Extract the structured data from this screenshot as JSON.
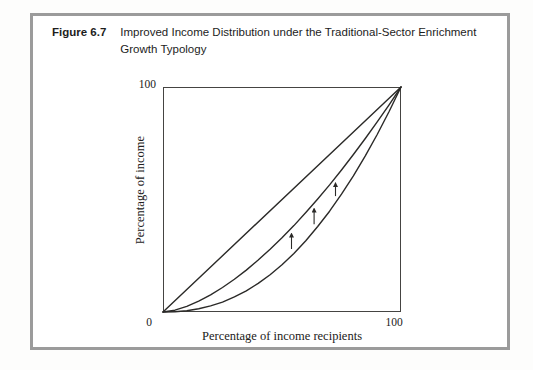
{
  "figure": {
    "label": "Figure 6.7",
    "title_line1": "Improved Income Distribution under the Traditional-Sector Enrichment",
    "title_line2": "Growth Typology"
  },
  "chart_data": {
    "type": "line",
    "xlabel": "Percentage of income recipients",
    "ylabel": "Percentage of income",
    "xlim": [
      0,
      100
    ],
    "ylim": [
      0,
      100
    ],
    "grid": false,
    "legend": "none",
    "ticks": {
      "origin": "0",
      "x_max": "100",
      "y_max": "100"
    },
    "series": [
      {
        "name": "line-of-equality",
        "description": "45-degree line of perfect equality",
        "points": [
          [
            0,
            0
          ],
          [
            100,
            100
          ]
        ]
      },
      {
        "name": "improved-lorenz-curve",
        "description": "Lorenz curve after traditional-sector enrichment growth (shifted up)",
        "points": [
          [
            0,
            0
          ],
          [
            5,
            0.8
          ],
          [
            10,
            2.5
          ],
          [
            15,
            4.8
          ],
          [
            20,
            7.6
          ],
          [
            25,
            10.9
          ],
          [
            30,
            14.6
          ],
          [
            35,
            18.6
          ],
          [
            40,
            23.1
          ],
          [
            45,
            27.9
          ],
          [
            50,
            33.0
          ],
          [
            55,
            38.4
          ],
          [
            60,
            44.2
          ],
          [
            65,
            50.2
          ],
          [
            70,
            56.5
          ],
          [
            75,
            63.1
          ],
          [
            80,
            70.0
          ],
          [
            85,
            77.1
          ],
          [
            90,
            84.5
          ],
          [
            95,
            92.1
          ],
          [
            100,
            100
          ]
        ]
      },
      {
        "name": "original-lorenz-curve",
        "description": "Original Lorenz curve (more unequal)",
        "points": [
          [
            0,
            0
          ],
          [
            5,
            0.1
          ],
          [
            10,
            0.6
          ],
          [
            15,
            1.4
          ],
          [
            20,
            2.7
          ],
          [
            25,
            4.4
          ],
          [
            30,
            6.7
          ],
          [
            35,
            9.4
          ],
          [
            40,
            12.7
          ],
          [
            45,
            16.6
          ],
          [
            50,
            21.0
          ],
          [
            55,
            26.0
          ],
          [
            60,
            31.7
          ],
          [
            65,
            38.0
          ],
          [
            70,
            44.8
          ],
          [
            75,
            52.4
          ],
          [
            80,
            60.5
          ],
          [
            85,
            69.4
          ],
          [
            90,
            78.9
          ],
          [
            95,
            89.1
          ],
          [
            100,
            100
          ]
        ]
      }
    ],
    "arrows": [
      {
        "x": 54.0,
        "y_from": 28.0,
        "y_to": 34.8
      },
      {
        "x": 63.5,
        "y_from": 39.0,
        "y_to": 45.9
      },
      {
        "x": 72.5,
        "y_from": 51.5,
        "y_to": 57.3
      }
    ]
  },
  "colors": {
    "frame_border": "#9b9b9b",
    "plot_border": "#454442",
    "curve": "#2b2a28",
    "text": "#1d1d1d",
    "background": "#ffffff"
  }
}
